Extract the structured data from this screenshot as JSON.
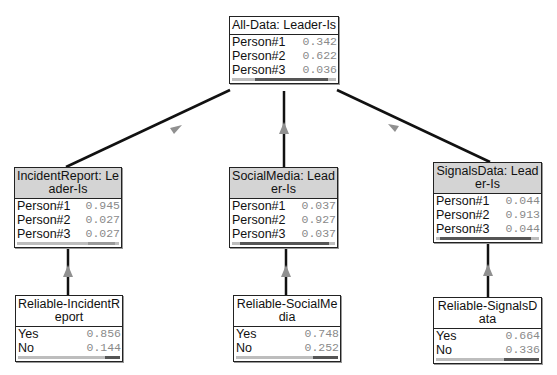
{
  "diagram": {
    "type": "bayesian-network",
    "nodes": [
      {
        "id": "all-data",
        "title": "All-Data: Leader-Is",
        "tinted": false,
        "states": [
          {
            "label": "Person#1",
            "value": "0.342"
          },
          {
            "label": "Person#2",
            "value": "0.622"
          },
          {
            "label": "Person#3",
            "value": "0.036"
          }
        ]
      },
      {
        "id": "incident-report",
        "title": "IncidentReport: Leader-Is",
        "tinted": true,
        "states": [
          {
            "label": "Person#1",
            "value": "0.945"
          },
          {
            "label": "Person#2",
            "value": "0.027"
          },
          {
            "label": "Person#3",
            "value": "0.027"
          }
        ]
      },
      {
        "id": "social-media",
        "title": "SocialMedia: Leader-Is",
        "tinted": true,
        "states": [
          {
            "label": "Person#1",
            "value": "0.037"
          },
          {
            "label": "Person#2",
            "value": "0.927"
          },
          {
            "label": "Person#3",
            "value": "0.037"
          }
        ]
      },
      {
        "id": "signals-data",
        "title": "SignalsData: Leader-Is",
        "tinted": true,
        "states": [
          {
            "label": "Person#1",
            "value": "0.044"
          },
          {
            "label": "Person#2",
            "value": "0.913"
          },
          {
            "label": "Person#3",
            "value": "0.044"
          }
        ]
      },
      {
        "id": "reliable-incident-report",
        "title": "Reliable-IncidentReport",
        "tinted": false,
        "states": [
          {
            "label": "Yes",
            "value": "0.856"
          },
          {
            "label": "No",
            "value": "0.144"
          }
        ]
      },
      {
        "id": "reliable-social-media",
        "title": "Reliable-SocialMedia",
        "tinted": false,
        "states": [
          {
            "label": "Yes",
            "value": "0.748"
          },
          {
            "label": "No",
            "value": "0.252"
          }
        ]
      },
      {
        "id": "reliable-signals-data",
        "title": "Reliable-SignalsData",
        "tinted": false,
        "states": [
          {
            "label": "Yes",
            "value": "0.664"
          },
          {
            "label": "No",
            "value": "0.336"
          }
        ]
      }
    ],
    "edges": [
      {
        "from": "incident-report",
        "to": "all-data"
      },
      {
        "from": "social-media",
        "to": "all-data"
      },
      {
        "from": "signals-data",
        "to": "all-data"
      },
      {
        "from": "reliable-incident-report",
        "to": "incident-report"
      },
      {
        "from": "reliable-social-media",
        "to": "social-media"
      },
      {
        "from": "reliable-signals-data",
        "to": "signals-data"
      }
    ]
  },
  "colors": {
    "header_tint": "#d4d4d4",
    "border": "#222222",
    "value_text": "#8a8a8a",
    "arrow": "#888888"
  }
}
